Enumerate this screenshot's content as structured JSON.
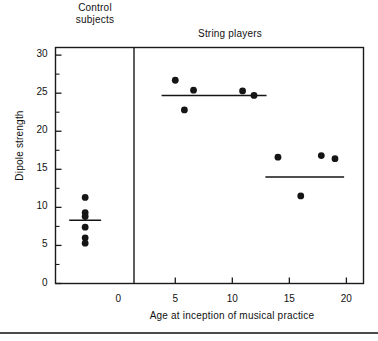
{
  "chart_data": {
    "type": "scatter",
    "title": "",
    "xlabel": "Age at inception of musical practice",
    "ylabel": "Dipole strength",
    "xlim": [
      -5.5,
      21.5
    ],
    "ylim": [
      0,
      31
    ],
    "xticks": [
      0,
      5,
      10,
      15,
      20
    ],
    "xtick_labels": [
      "0",
      "5",
      "10",
      "15",
      "20"
    ],
    "yticks": [
      0,
      5,
      10,
      15,
      20,
      25,
      30
    ],
    "ytick_labels": [
      "0",
      "5",
      "10",
      "15",
      "20",
      "25",
      "30"
    ],
    "yminorticks": [
      2.5,
      7.5,
      12.5,
      17.5,
      22.5,
      27.5
    ],
    "grid": false,
    "legend": "none",
    "group_labels": {
      "control": "Control\nsubjects",
      "string": "String players"
    },
    "divider_x": 0,
    "series": [
      {
        "name": "Control subjects",
        "points": [
          {
            "x": -2.9,
            "y": 11.3
          },
          {
            "x": -2.9,
            "y": 9.3
          },
          {
            "x": -2.9,
            "y": 8.8
          },
          {
            "x": -2.9,
            "y": 7.4
          },
          {
            "x": -2.9,
            "y": 6.0
          },
          {
            "x": -2.9,
            "y": 5.3
          }
        ],
        "mean": 8.3,
        "mean_line": {
          "x_start": -4.3,
          "x_end": -1.5,
          "y": 8.3
        }
      },
      {
        "name": "String players - early inception",
        "points": [
          {
            "x": 5.0,
            "y": 26.7
          },
          {
            "x": 5.8,
            "y": 22.8
          },
          {
            "x": 6.6,
            "y": 25.4
          },
          {
            "x": 10.9,
            "y": 25.3
          },
          {
            "x": 11.9,
            "y": 24.7
          }
        ],
        "mean": 24.7,
        "mean_line": {
          "x_start": 3.8,
          "x_end": 13.0,
          "y": 24.7
        }
      },
      {
        "name": "String players - late inception",
        "points": [
          {
            "x": 14.0,
            "y": 16.6
          },
          {
            "x": 16.0,
            "y": 11.5
          },
          {
            "x": 17.8,
            "y": 16.8
          },
          {
            "x": 19.0,
            "y": 16.4
          }
        ],
        "mean": 14.0,
        "mean_line": {
          "x_start": 12.9,
          "x_end": 19.8,
          "y": 14.0
        }
      }
    ]
  },
  "axis_colors": {
    "frame": "#1a1a1a",
    "point": "#151515",
    "mean_line": "#151515"
  }
}
